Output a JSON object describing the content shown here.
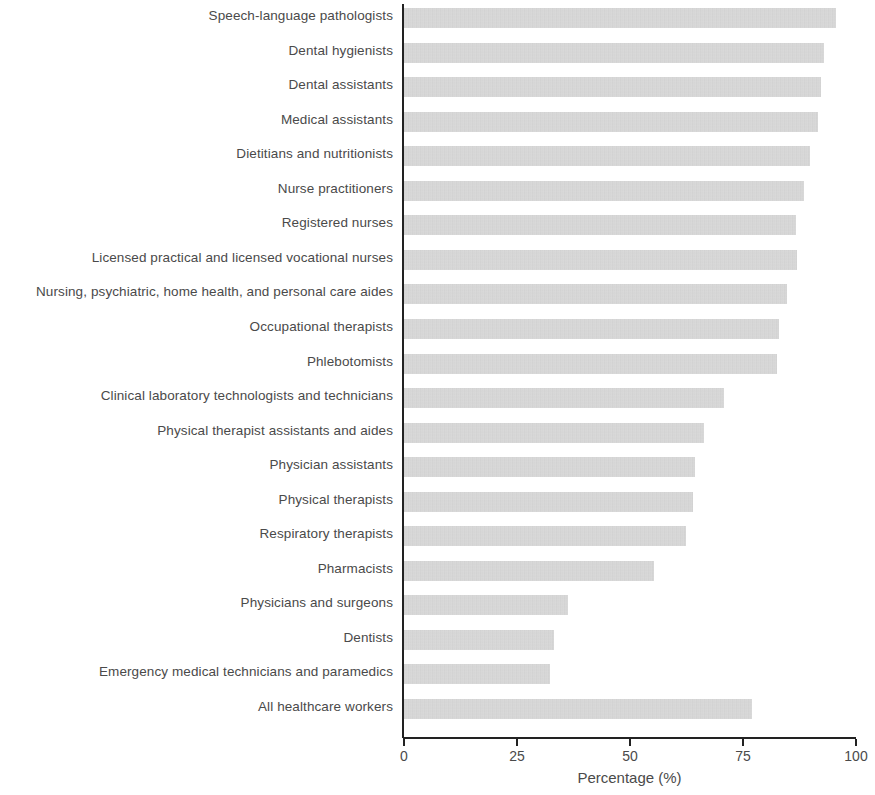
{
  "chart_data": {
    "type": "bar",
    "orientation": "horizontal",
    "title": "",
    "xlabel": "Percentage (%)",
    "ylabel": "",
    "xlim": [
      0,
      100
    ],
    "xticks": [
      0,
      25,
      50,
      75,
      100
    ],
    "grid": false,
    "legend": null,
    "bar_color": "#d2d2d2",
    "axis_color": "#222222",
    "categories": [
      "Speech-language pathologists",
      "Dental hygienists",
      "Dental assistants",
      "Medical assistants",
      "Dietitians and nutritionists",
      "Nurse practitioners",
      "Registered nurses",
      "Licensed practical and licensed vocational nurses",
      "Nursing, psychiatric, home health, and personal care aides",
      "Occupational therapists",
      "Phlebotomists",
      "Clinical laboratory technologists and technicians",
      "Physical therapist assistants and aides",
      "Physician assistants",
      "Physical therapists",
      "Respiratory therapists",
      "Pharmacists",
      "Physicians and surgeons",
      "Dentists",
      "Emergency medical technicians and paramedics",
      "All healthcare workers"
    ],
    "values": [
      95.5,
      93.0,
      92.2,
      91.5,
      89.8,
      88.4,
      86.8,
      87.0,
      84.8,
      82.9,
      82.5,
      70.8,
      66.4,
      64.3,
      63.9,
      62.3,
      55.4,
      36.2,
      33.2,
      32.2,
      77.0
    ]
  },
  "axis": {
    "x_title": "Percentage (%)",
    "tick_labels": [
      "0",
      "25",
      "50",
      "75",
      "100"
    ]
  }
}
